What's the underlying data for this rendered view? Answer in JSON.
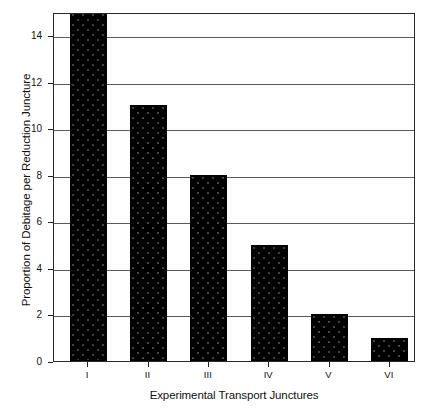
{
  "chart_data": {
    "type": "bar",
    "title": "",
    "subtitle": "",
    "xlabel": "Experimental Transport Junctures",
    "ylabel": "Proportion of Debitage per Reduction Juncture",
    "categories": [
      "I",
      "II",
      "III",
      "IV",
      "V",
      "VI"
    ],
    "values": [
      15,
      11,
      8,
      5,
      2,
      1
    ],
    "series": [
      {
        "name": "Proportion of Debitage per Reduction Juncture",
        "values": [
          15,
          11,
          8,
          5,
          2,
          1
        ]
      }
    ],
    "ylim": [
      0,
      15
    ],
    "ytick_values": [
      0,
      2,
      4,
      6,
      8,
      10,
      12,
      14
    ],
    "ytick_labels": [
      "0",
      "2",
      "4",
      "6",
      "8",
      "10",
      "12",
      "14"
    ],
    "xtick_labels": [
      "I",
      "II",
      "III",
      "IV",
      "V",
      "VI"
    ],
    "grid": "horizontal",
    "legend": "none",
    "bar_color": "#000000",
    "bar_pattern": "dotted",
    "plot_border_color": "#2a2a2a",
    "gridline_color": "#5a5a5a",
    "background_color": "#ffffff",
    "annotations": []
  }
}
